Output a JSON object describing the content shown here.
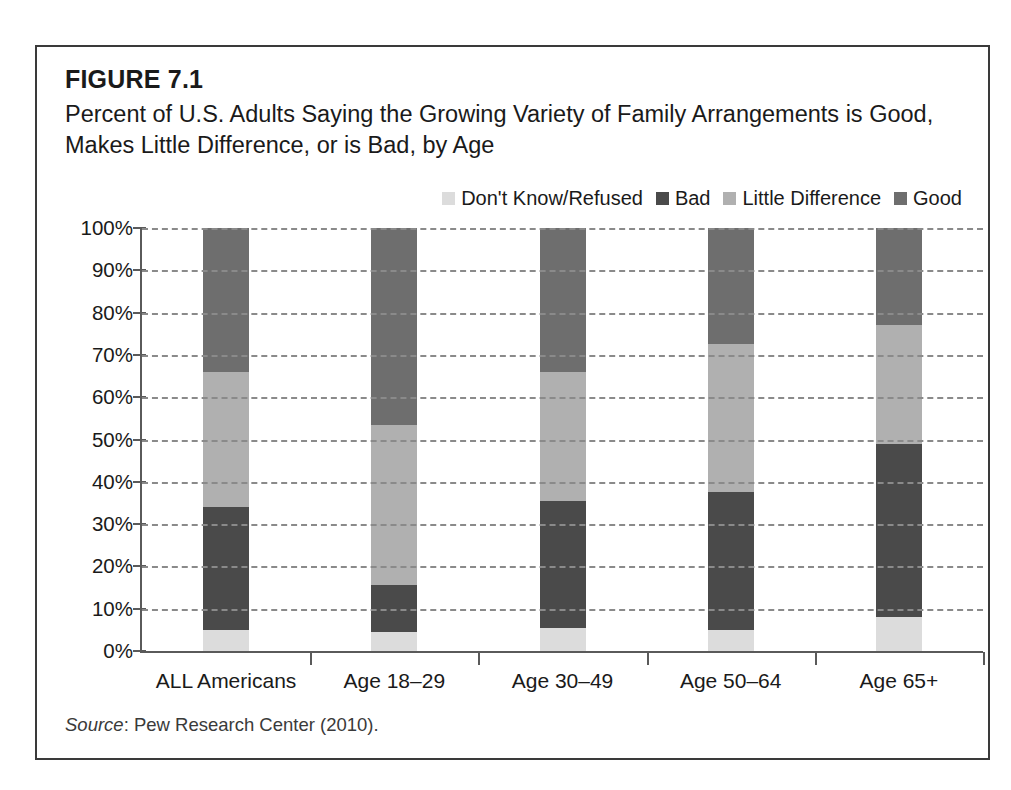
{
  "figure": {
    "label": "FIGURE 7.1",
    "title": "Percent of U.S. Adults Saying the Growing Variety of Family Arrangements is Good, Makes Little Difference, or is Bad, by Age",
    "source_word": "Source",
    "source_rest": ": Pew Research Center (2010)."
  },
  "colors": {
    "dont_know": "#dcdcdc",
    "bad": "#4a4a4a",
    "little_difference": "#b0b0b0",
    "good": "#6e6e6e",
    "axis": "#5a5a5a",
    "gridline": "#8a8a8a",
    "frame": "#3a3a3a",
    "text": "#1a1a1a"
  },
  "chart_data": {
    "type": "bar",
    "subtype": "stacked-vertical-100-percent",
    "title": "Percent of U.S. Adults Saying the Growing Variety of Family Arrangements is Good, Makes Little Difference, or is Bad, by Age",
    "xlabel": "",
    "ylabel": "",
    "ylim": [
      0,
      100
    ],
    "yticks": [
      0,
      10,
      20,
      30,
      40,
      50,
      60,
      70,
      80,
      90,
      100
    ],
    "ytick_labels": [
      "0%",
      "10%",
      "20%",
      "30%",
      "40%",
      "50%",
      "60%",
      "70%",
      "80%",
      "90%",
      "100%"
    ],
    "grid": true,
    "grid_style": "dashed-horizontal",
    "legend_position": "top-right",
    "legend_order": [
      "Don't Know/Refused",
      "Bad",
      "Little Difference",
      "Good"
    ],
    "stack_order_bottom_to_top": [
      "Don't Know/Refused",
      "Bad",
      "Little Difference",
      "Good"
    ],
    "categories": [
      "ALL Americans",
      "Age 18–29",
      "Age 30–49",
      "Age 50–64",
      "Age 65+"
    ],
    "series": [
      {
        "name": "Don't Know/Refused",
        "color": "#dcdcdc",
        "values": [
          5,
          4.5,
          5.5,
          5,
          8
        ]
      },
      {
        "name": "Bad",
        "color": "#4a4a4a",
        "values": [
          29,
          11,
          30,
          32.5,
          41
        ]
      },
      {
        "name": "Little Difference",
        "color": "#b0b0b0",
        "values": [
          32,
          38,
          30.5,
          35,
          28
        ]
      },
      {
        "name": "Good",
        "color": "#6e6e6e",
        "values": [
          34,
          46.5,
          34,
          27.5,
          23
        ]
      }
    ],
    "cumulative_tops": {
      "ALL Americans": {
        "Don't Know/Refused": 5,
        "Bad": 34,
        "Little Difference": 66,
        "Good": 100
      },
      "Age 18–29": {
        "Don't Know/Refused": 4.5,
        "Bad": 15.5,
        "Little Difference": 53.5,
        "Good": 100
      },
      "Age 30–49": {
        "Don't Know/Refused": 5.5,
        "Bad": 35.5,
        "Little Difference": 66,
        "Good": 100
      },
      "Age 50–64": {
        "Don't Know/Refused": 5,
        "Bad": 37.5,
        "Little Difference": 72.5,
        "Good": 100
      },
      "Age 65+": {
        "Don't Know/Refused": 8,
        "Bad": 49,
        "Little Difference": 77,
        "Good": 100
      }
    }
  }
}
